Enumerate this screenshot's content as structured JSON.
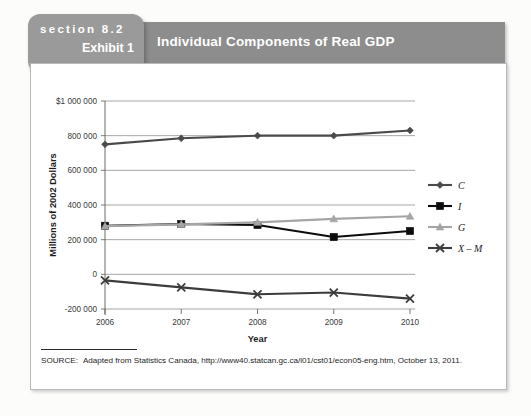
{
  "header": {
    "section_label": "section 8.2",
    "exhibit_label": "Exhibit 1",
    "title": "Individual Components of Real GDP",
    "banner_color": "#8d8d8d",
    "tab_color": "#9a9a9a"
  },
  "source": {
    "label": "SOURCE:",
    "text": "Adapted from Statistics Canada, http://www40.statcan.gc.ca/l01/cst01/econ05-eng.htm, October 13, 2011."
  },
  "chart_data": {
    "type": "line",
    "title": "Individual Components of Real GDP",
    "xlabel": "Year",
    "ylabel": "Millions of 2002 Dollars",
    "categories": [
      "2006",
      "2007",
      "2008",
      "2009",
      "2010"
    ],
    "x": [
      2006,
      2007,
      2008,
      2009,
      2010
    ],
    "ylim": [
      -200000,
      1000000
    ],
    "yticks": [
      -200000,
      0,
      200000,
      400000,
      600000,
      800000,
      1000000
    ],
    "ytick_labels": [
      "-200 000",
      "0",
      "200 000",
      "400 000",
      "600 000",
      "800 000",
      "$1 000 000"
    ],
    "grid": true,
    "legend_position": "right",
    "series": [
      {
        "name": "C",
        "marker": "diamond",
        "color": "#4a4a4a",
        "values": [
          750000,
          785000,
          800000,
          800000,
          830000
        ]
      },
      {
        "name": "I",
        "marker": "square",
        "color": "#0d0d0d",
        "values": [
          280000,
          290000,
          285000,
          215000,
          250000
        ]
      },
      {
        "name": "G",
        "marker": "triangle",
        "color": "#a5a5a5",
        "values": [
          278000,
          288000,
          300000,
          320000,
          335000
        ]
      },
      {
        "name": "X – M",
        "marker": "x",
        "color": "#3c3c3c",
        "values": [
          -35000,
          -75000,
          -115000,
          -105000,
          -140000
        ]
      }
    ]
  }
}
